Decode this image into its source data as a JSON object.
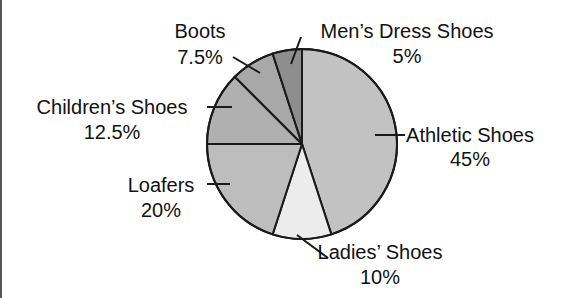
{
  "chart_data": {
    "type": "pie",
    "title": "",
    "start_angle_deg": 0,
    "direction": "clockwise",
    "legend": "none (direct labels with leader lines)",
    "slices": [
      {
        "label": "Athletic Shoes",
        "value": 45,
        "display": "45%",
        "color": "#c2c2c2"
      },
      {
        "label": "Ladies’ Shoes",
        "value": 10,
        "display": "10%",
        "color": "#ececec"
      },
      {
        "label": "Loafers",
        "value": 20,
        "display": "20%",
        "color": "#bdbdbd"
      },
      {
        "label": "Children’s Shoes",
        "value": 12.5,
        "display": "12.5%",
        "color": "#b0b0b0"
      },
      {
        "label": "Boots",
        "value": 7.5,
        "display": "7.5%",
        "color": "#a8a8a8"
      },
      {
        "label": "Men’s Dress Shoes",
        "value": 5,
        "display": "5%",
        "color": "#8e8e8e"
      }
    ],
    "categories": [
      "Athletic Shoes",
      "Ladies’ Shoes",
      "Loafers",
      "Children’s Shoes",
      "Boots",
      "Men’s Dress Shoes"
    ],
    "values": [
      45,
      10,
      20,
      12.5,
      7.5,
      5
    ]
  },
  "labels": {
    "athletic": {
      "name": "Athletic Shoes",
      "pct": "45%"
    },
    "ladies": {
      "name": "Ladies’ Shoes",
      "pct": "10%"
    },
    "loafers": {
      "name": "Loafers",
      "pct": "20%"
    },
    "children": {
      "name": "Children’s Shoes",
      "pct": "12.5%"
    },
    "boots": {
      "name": "Boots",
      "pct": "7.5%"
    },
    "mens": {
      "name": "Men’s Dress Shoes",
      "pct": "5%"
    }
  }
}
